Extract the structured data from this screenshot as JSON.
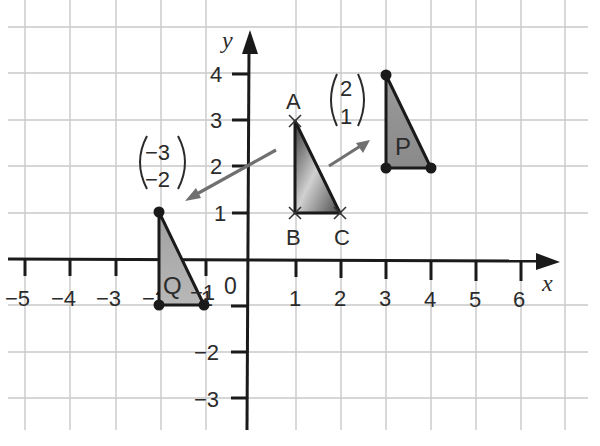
{
  "diagram": {
    "axes": {
      "x_label": "x",
      "y_label": "y",
      "x_ticks": [
        "-5",
        "-4",
        "-3",
        "-2",
        "-1",
        "1",
        "2",
        "3",
        "4",
        "5",
        "6"
      ],
      "y_ticks": [
        "4",
        "3",
        "2",
        "1",
        "-1",
        "-2",
        "-3"
      ],
      "origin_label": "0",
      "x_range": [
        -5,
        6
      ],
      "y_range": [
        -3,
        4
      ],
      "grid": true
    },
    "shapes": {
      "ABC": {
        "vertices": [
          {
            "label": "A",
            "x": 1,
            "y": 3
          },
          {
            "label": "B",
            "x": 1,
            "y": 1
          },
          {
            "label": "C",
            "x": 2,
            "y": 1
          }
        ],
        "marker": "cross"
      },
      "P": {
        "label": "P",
        "vertices": [
          {
            "x": 3,
            "y": 4
          },
          {
            "x": 3,
            "y": 2
          },
          {
            "x": 4,
            "y": 2
          }
        ],
        "marker": "dot"
      },
      "Q": {
        "label": "Q",
        "vertices": [
          {
            "x": -2,
            "y": 1
          },
          {
            "x": -2,
            "y": -1
          },
          {
            "x": -1,
            "y": -1
          }
        ],
        "marker": "dot"
      }
    },
    "vectors": {
      "to_P": {
        "top": "2",
        "bottom": "1"
      },
      "to_Q": {
        "top": "-3",
        "bottom": "-2"
      }
    },
    "colors": {
      "grid": "#c8c8c8",
      "axis": "#1a1a1a",
      "arrow": "#707070",
      "shape_fill_dark": "#555555",
      "shape_fill_light": "#d8d8d8"
    }
  }
}
